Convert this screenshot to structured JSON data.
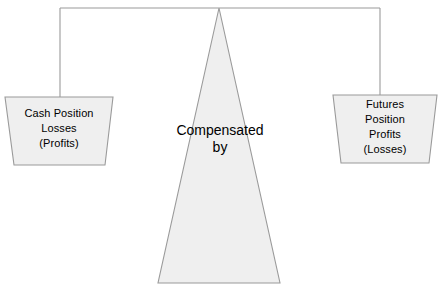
{
  "diagram": {
    "background_color": "#ffffff",
    "stroke_color": "#999999",
    "shape_fill_color": "#efefef",
    "text_color": "#000000",
    "beam": {
      "name": "balance-beam"
    },
    "fulcrum": {
      "name": "fulcrum-triangle",
      "lines": [
        "Compensated",
        "by"
      ],
      "line1": "Compensated",
      "line2": "by"
    },
    "left_pan": {
      "name": "cash-position-pan",
      "lines": [
        "Cash Position",
        "Losses",
        "(Profits)"
      ],
      "line1": "Cash Position",
      "line2": "Losses",
      "line3": "(Profits)"
    },
    "right_pan": {
      "name": "futures-position-pan",
      "lines": [
        "Futures",
        "Position",
        "Profits",
        "(Losses)"
      ],
      "line1": "Futures",
      "line2": "Position",
      "line3": "Profits",
      "line4": "(Losses)"
    }
  }
}
